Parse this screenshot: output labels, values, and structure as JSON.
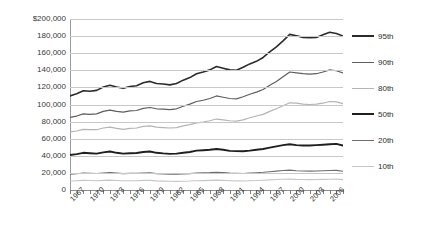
{
  "chart_data": {
    "type": "line",
    "title": "",
    "xlabel": "",
    "ylabel": "",
    "ylim": [
      0,
      200000
    ],
    "ytick_values": [
      200000,
      180000,
      160000,
      140000,
      120000,
      100000,
      80000,
      60000,
      40000,
      20000,
      0
    ],
    "ytick_labels": [
      "$200,000",
      "180,000",
      "160,000",
      "140,000",
      "120,000",
      "100,000",
      "80,000",
      "60,000",
      "40,000",
      "20,000",
      "0"
    ],
    "grid": true,
    "legend_position": "right",
    "xlim": [
      1967,
      2008
    ],
    "x": [
      1967,
      1968,
      1969,
      1970,
      1971,
      1972,
      1973,
      1974,
      1975,
      1976,
      1977,
      1978,
      1979,
      1980,
      1981,
      1982,
      1983,
      1984,
      1985,
      1986,
      1987,
      1988,
      1989,
      1990,
      1991,
      1992,
      1993,
      1994,
      1995,
      1996,
      1997,
      1998,
      1999,
      2000,
      2001,
      2002,
      2003,
      2004,
      2005,
      2006,
      2007,
      2008
    ],
    "xtick_labels": [
      "1967",
      "1970",
      "1973",
      "1976",
      "1979",
      "1982",
      "1985",
      "1988",
      "1991",
      "1994",
      "1997",
      "2000",
      "2003",
      "2006"
    ],
    "xtick_years": [
      1967,
      1970,
      1973,
      1976,
      1979,
      1982,
      1985,
      1988,
      1991,
      1994,
      1997,
      2000,
      2003,
      2006
    ],
    "series": [
      {
        "name": "95th",
        "color": "#2b2b2b",
        "width": 1.6,
        "values": [
          110000,
          112500,
          116000,
          115500,
          116500,
          120500,
          122500,
          120500,
          119000,
          121000,
          122000,
          125500,
          127000,
          124500,
          124000,
          123000,
          124500,
          128500,
          131500,
          136000,
          138000,
          140500,
          144500,
          142500,
          140500,
          140000,
          143500,
          147500,
          150500,
          155000,
          161500,
          167500,
          174500,
          182000,
          180500,
          178500,
          178000,
          178500,
          181500,
          184500,
          183000,
          180000
        ]
      },
      {
        "name": "90th",
        "color": "#5e5e5e",
        "width": 1.2,
        "values": [
          85000,
          86500,
          89000,
          88500,
          89000,
          92000,
          93500,
          92000,
          91000,
          92500,
          93000,
          95500,
          96500,
          95000,
          94500,
          94000,
          95000,
          98000,
          100500,
          103500,
          105000,
          107000,
          110000,
          108500,
          107000,
          106500,
          109000,
          112000,
          114500,
          117500,
          122500,
          127000,
          132500,
          138000,
          137000,
          136000,
          135500,
          136000,
          138000,
          140500,
          139500,
          137000
        ]
      },
      {
        "name": "80th",
        "color": "#b4b4b4",
        "width": 1.2,
        "values": [
          68000,
          69000,
          71000,
          70500,
          70500,
          72500,
          73500,
          72000,
          71000,
          72000,
          72500,
          74500,
          75000,
          73500,
          73000,
          72500,
          73000,
          75000,
          76500,
          78500,
          79500,
          81000,
          83000,
          82000,
          81000,
          80500,
          82000,
          84500,
          86500,
          88500,
          92000,
          95000,
          98500,
          102000,
          101500,
          100500,
          100000,
          100500,
          101500,
          103500,
          103000,
          101000
        ]
      },
      {
        "name": "50th",
        "color": "#1f1f1f",
        "width": 1.9,
        "values": [
          41000,
          42000,
          43500,
          43000,
          42500,
          44000,
          45000,
          43500,
          42500,
          43000,
          43200,
          44500,
          45000,
          43500,
          42800,
          42300,
          42500,
          43500,
          44500,
          46000,
          46500,
          47000,
          48000,
          47000,
          45800,
          45500,
          45300,
          46000,
          47000,
          48000,
          49500,
          51000,
          52500,
          53500,
          52500,
          52000,
          52000,
          52500,
          53000,
          53500,
          54000,
          52000
        ]
      },
      {
        "name": "20th",
        "color": "#6e6e6e",
        "width": 1.1,
        "values": [
          18500,
          19000,
          19800,
          19600,
          19300,
          19900,
          20300,
          19700,
          19200,
          19400,
          19400,
          19900,
          20000,
          19200,
          18800,
          18500,
          18400,
          18800,
          19200,
          19800,
          20000,
          20300,
          20800,
          20300,
          19700,
          19500,
          19300,
          19700,
          20200,
          20700,
          21400,
          22100,
          22800,
          23200,
          22600,
          22200,
          22100,
          22200,
          22500,
          22800,
          23000,
          22000
        ]
      },
      {
        "name": "10th",
        "color": "#c6c6c6",
        "width": 1.1,
        "values": [
          10500,
          10800,
          11200,
          11100,
          10900,
          11200,
          11500,
          11100,
          10800,
          10900,
          10900,
          11200,
          11200,
          10700,
          10400,
          10200,
          10100,
          10300,
          10500,
          10900,
          11000,
          11200,
          11500,
          11200,
          10800,
          10700,
          10600,
          10800,
          11100,
          11400,
          11800,
          12200,
          12600,
          12800,
          12400,
          12200,
          12100,
          12200,
          12400,
          12600,
          12700,
          12100
        ]
      }
    ]
  }
}
